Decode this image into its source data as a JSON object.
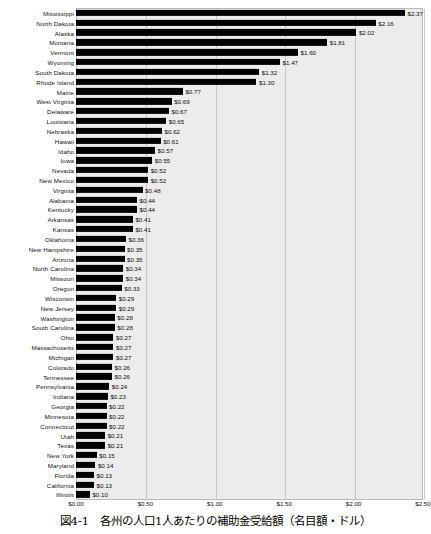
{
  "caption": "図4-1　各州の人口1人あたりの補助金受給額（名目額・ドル）",
  "chart_data": {
    "type": "bar",
    "orientation": "horizontal",
    "title": "図4-1　各州の人口1人あたりの補助金受給額（名目額・ドル）",
    "xlabel": "",
    "ylabel": "",
    "xlim": [
      0,
      2.5
    ],
    "grid": true,
    "legend": null,
    "value_prefix": "$",
    "tick_labels": [
      "$0.00",
      "$0.50",
      "$1.00",
      "$1.50",
      "$2.00",
      "$2.50"
    ],
    "ticks": [
      0,
      0.5,
      1.0,
      1.5,
      2.0,
      2.5
    ],
    "categories": [
      "Mississippi",
      "North Dakota",
      "Alaska",
      "Montana",
      "Vermont",
      "Wyoming",
      "South Dakota",
      "Rhode Island",
      "Maine",
      "West Virginia",
      "Delaware",
      "Louisiana",
      "Nebraska",
      "Hawaii",
      "Idaho",
      "Iowa",
      "Nevada",
      "New Mexico",
      "Virginia",
      "Alabama",
      "Kentucky",
      "Arkansas",
      "Kansas",
      "Oklahoma",
      "New Hampshire",
      "Arizona",
      "North Carolina",
      "Missouri",
      "Oregon",
      "Wisconsin",
      "New Jersey",
      "Washington",
      "South Carolina",
      "Ohio",
      "Massachusetts",
      "Michigan",
      "Colorado",
      "Tennessee",
      "Pennsylvania",
      "Indiana",
      "Georgia",
      "Minnesota",
      "Connecticut",
      "Utah",
      "Texas",
      "New York",
      "Maryland",
      "Florida",
      "California",
      "Illinois"
    ],
    "values": [
      2.37,
      2.16,
      2.02,
      1.81,
      1.6,
      1.47,
      1.32,
      1.3,
      0.77,
      0.69,
      0.67,
      0.65,
      0.62,
      0.61,
      0.57,
      0.55,
      0.52,
      0.52,
      0.48,
      0.44,
      0.44,
      0.41,
      0.41,
      0.36,
      0.35,
      0.35,
      0.34,
      0.34,
      0.33,
      0.29,
      0.29,
      0.28,
      0.28,
      0.27,
      0.27,
      0.27,
      0.26,
      0.26,
      0.24,
      0.23,
      0.22,
      0.22,
      0.22,
      0.21,
      0.21,
      0.15,
      0.14,
      0.13,
      0.13,
      0.1
    ],
    "value_labels": [
      "$2.37",
      "$2.16",
      "$2.02",
      "$1.81",
      "$1.60",
      "$1.47",
      "$1.32",
      "$1.30",
      "$0.77",
      "$0.69",
      "$0.67",
      "$0.65",
      "$0.62",
      "$0.61",
      "$0.57",
      "$0.55",
      "$0.52",
      "$0.52",
      "$0.48",
      "$0.44",
      "$0.44",
      "$0.41",
      "$0.41",
      "$0.36",
      "$0.35",
      "$0.35",
      "$0.34",
      "$0.34",
      "$0.33",
      "$0.29",
      "$0.29",
      "$0.28",
      "$0.28",
      "$0.27",
      "$0.27",
      "$0.27",
      "$0.26",
      "$0.26",
      "$0.24",
      "$0.23",
      "$0.22",
      "$0.22",
      "$0.22",
      "$0.21",
      "$0.21",
      "$0.15",
      "$0.14",
      "$0.13",
      "$0.13",
      "$0.10"
    ],
    "colors": {
      "bar": "#000000",
      "plot_background": "#ececec",
      "gridline": "#c9c9c9",
      "text": "#111111"
    }
  }
}
